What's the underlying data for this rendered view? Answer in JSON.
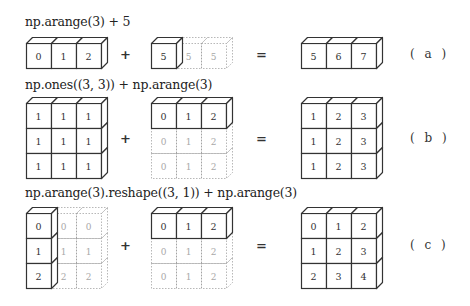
{
  "figure": {
    "rows": [
      {
        "id": "a",
        "expression": "np.arange(3) + 5",
        "label": "( a )",
        "plus": "+",
        "equals": "=",
        "left": {
          "shape": [
            1,
            3
          ],
          "values": [
            [
              "0",
              "1",
              "2"
            ]
          ],
          "solid_cols": 3,
          "solid_rows": 1
        },
        "right": {
          "shape": [
            1,
            3
          ],
          "values": [
            [
              "5",
              "5",
              "5"
            ]
          ],
          "solid_cols": 1,
          "solid_rows": 1
        },
        "result": {
          "shape": [
            1,
            3
          ],
          "values": [
            [
              "5",
              "6",
              "7"
            ]
          ],
          "solid_cols": 3,
          "solid_rows": 1
        }
      },
      {
        "id": "b",
        "expression": "np.ones((3, 3)) + np.arange(3)",
        "label": "( b )",
        "plus": "+",
        "equals": "=",
        "left": {
          "shape": [
            3,
            3
          ],
          "values": [
            [
              "1",
              "1",
              "1"
            ],
            [
              "1",
              "1",
              "1"
            ],
            [
              "1",
              "1",
              "1"
            ]
          ],
          "solid_cols": 3,
          "solid_rows": 3
        },
        "right": {
          "shape": [
            3,
            3
          ],
          "values": [
            [
              "0",
              "1",
              "2"
            ],
            [
              "0",
              "1",
              "2"
            ],
            [
              "0",
              "1",
              "2"
            ]
          ],
          "solid_cols": 3,
          "solid_rows": 1
        },
        "result": {
          "shape": [
            3,
            3
          ],
          "values": [
            [
              "1",
              "2",
              "3"
            ],
            [
              "1",
              "2",
              "3"
            ],
            [
              "1",
              "2",
              "3"
            ]
          ],
          "solid_cols": 3,
          "solid_rows": 3
        }
      },
      {
        "id": "c",
        "expression": "np.arange(3).reshape((3, 1)) + np.arange(3)",
        "label": "( c )",
        "plus": "+",
        "equals": "=",
        "left": {
          "shape": [
            3,
            3
          ],
          "values": [
            [
              "0",
              "0",
              "0"
            ],
            [
              "1",
              "1",
              "1"
            ],
            [
              "2",
              "2",
              "2"
            ]
          ],
          "solid_cols": 1,
          "solid_rows": 3
        },
        "right": {
          "shape": [
            3,
            3
          ],
          "values": [
            [
              "0",
              "1",
              "2"
            ],
            [
              "0",
              "1",
              "2"
            ],
            [
              "0",
              "1",
              "2"
            ]
          ],
          "solid_cols": 3,
          "solid_rows": 1
        },
        "result": {
          "shape": [
            3,
            3
          ],
          "values": [
            [
              "0",
              "1",
              "2"
            ],
            [
              "1",
              "2",
              "3"
            ],
            [
              "2",
              "3",
              "4"
            ]
          ],
          "solid_cols": 3,
          "solid_rows": 3
        }
      }
    ],
    "colors": {
      "solid_stroke": "#333333",
      "ghost_stroke": "#9a9a9a",
      "solid_text": "#333333",
      "ghost_text": "#a8a8a8"
    }
  }
}
